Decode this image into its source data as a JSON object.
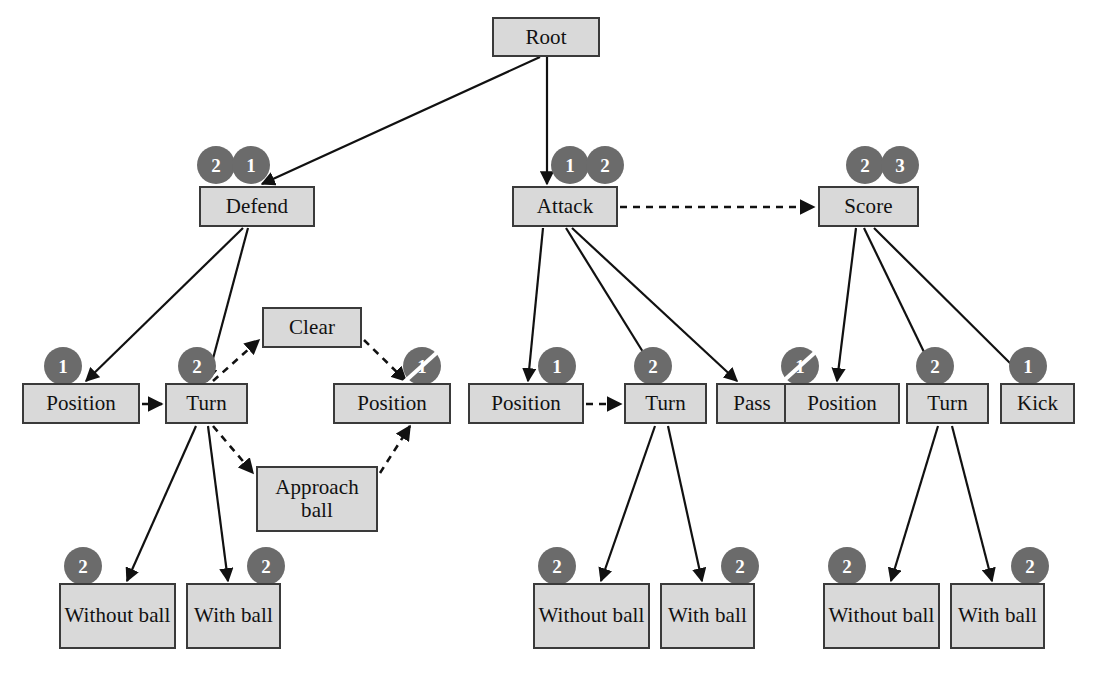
{
  "figure": {
    "background_color": "#ffffff",
    "node_fill": "#d9d9d9",
    "node_border": "#3a3a3a",
    "badge_fill": "#6b6b6b",
    "badge_text_color": "#ffffff",
    "edge_color": "#111111"
  },
  "header": {
    "running_head": "",
    "page_number": ""
  },
  "nodes": [
    {
      "id": "root",
      "label": "Root",
      "x": 492,
      "y": 17,
      "w": 108,
      "h": 40
    },
    {
      "id": "defend",
      "label": "Defend",
      "x": 199,
      "y": 186,
      "w": 116,
      "h": 41
    },
    {
      "id": "attack",
      "label": "Attack",
      "x": 512,
      "y": 186,
      "w": 106,
      "h": 41
    },
    {
      "id": "score",
      "label": "Score",
      "x": 818,
      "y": 186,
      "w": 101,
      "h": 41
    },
    {
      "id": "d-position",
      "label": "Position",
      "x": 22,
      "y": 383,
      "w": 118,
      "h": 41
    },
    {
      "id": "d-turn",
      "label": "Turn",
      "x": 165,
      "y": 383,
      "w": 83,
      "h": 41
    },
    {
      "id": "d-clear",
      "label": "Clear",
      "x": 262,
      "y": 307,
      "w": 100,
      "h": 41
    },
    {
      "id": "d-approach",
      "label": "Approach ball",
      "x": 256,
      "y": 466,
      "w": 122,
      "h": 66
    },
    {
      "id": "d-position2",
      "label": "Position",
      "x": 333,
      "y": 383,
      "w": 118,
      "h": 41
    },
    {
      "id": "d-without",
      "label": "Without ball",
      "x": 59,
      "y": 583,
      "w": 117,
      "h": 66
    },
    {
      "id": "d-with",
      "label": "With ball",
      "x": 186,
      "y": 583,
      "w": 95,
      "h": 66
    },
    {
      "id": "a-position",
      "label": "Position",
      "x": 468,
      "y": 383,
      "w": 116,
      "h": 41
    },
    {
      "id": "a-turn",
      "label": "Turn",
      "x": 624,
      "y": 383,
      "w": 83,
      "h": 41
    },
    {
      "id": "a-pass",
      "label": "Pass",
      "x": 716,
      "y": 383,
      "w": 72,
      "h": 41
    },
    {
      "id": "a-without",
      "label": "Without ball",
      "x": 533,
      "y": 583,
      "w": 117,
      "h": 66
    },
    {
      "id": "a-with",
      "label": "With ball",
      "x": 660,
      "y": 583,
      "w": 95,
      "h": 66
    },
    {
      "id": "s-position",
      "label": "Position",
      "x": 784,
      "y": 383,
      "w": 116,
      "h": 41
    },
    {
      "id": "s-turn",
      "label": "Turn",
      "x": 906,
      "y": 383,
      "w": 83,
      "h": 41
    },
    {
      "id": "s-kick",
      "label": "Kick",
      "x": 1000,
      "y": 383,
      "w": 75,
      "h": 41
    },
    {
      "id": "s-without",
      "label": "Without ball",
      "x": 823,
      "y": 583,
      "w": 117,
      "h": 66
    },
    {
      "id": "s-with",
      "label": "With ball",
      "x": 950,
      "y": 583,
      "w": 95,
      "h": 66
    }
  ],
  "badges": [
    {
      "for": "defend",
      "value": "2",
      "x": 197,
      "y": 146,
      "struck": false
    },
    {
      "for": "defend",
      "value": "1",
      "x": 232,
      "y": 146,
      "struck": false
    },
    {
      "for": "attack",
      "value": "1",
      "x": 551,
      "y": 146,
      "struck": false
    },
    {
      "for": "attack",
      "value": "2",
      "x": 586,
      "y": 146,
      "struck": false
    },
    {
      "for": "score",
      "value": "2",
      "x": 846,
      "y": 146,
      "struck": false
    },
    {
      "for": "score",
      "value": "3",
      "x": 881,
      "y": 146,
      "struck": false
    },
    {
      "for": "d-position",
      "value": "1",
      "x": 44,
      "y": 347,
      "struck": false
    },
    {
      "for": "d-turn",
      "value": "2",
      "x": 178,
      "y": 347,
      "struck": false
    },
    {
      "for": "d-position2",
      "value": "1",
      "x": 403,
      "y": 347,
      "struck": true
    },
    {
      "for": "d-without",
      "value": "2",
      "x": 64,
      "y": 547,
      "struck": false
    },
    {
      "for": "d-with",
      "value": "2",
      "x": 247,
      "y": 547,
      "struck": false
    },
    {
      "for": "a-position",
      "value": "1",
      "x": 538,
      "y": 347,
      "struck": false
    },
    {
      "for": "a-turn",
      "value": "2",
      "x": 634,
      "y": 347,
      "struck": false
    },
    {
      "for": "s-position",
      "value": "1",
      "x": 781,
      "y": 347,
      "struck": true
    },
    {
      "for": "s-turn",
      "value": "2",
      "x": 916,
      "y": 347,
      "struck": false
    },
    {
      "for": "s-kick",
      "value": "1",
      "x": 1009,
      "y": 347,
      "struck": false
    },
    {
      "for": "a-without",
      "value": "2",
      "x": 538,
      "y": 547,
      "struck": false
    },
    {
      "for": "a-with",
      "value": "2",
      "x": 721,
      "y": 547,
      "struck": false
    },
    {
      "for": "s-without",
      "value": "2",
      "x": 828,
      "y": 547,
      "struck": false
    },
    {
      "for": "s-with",
      "value": "2",
      "x": 1011,
      "y": 547,
      "struck": false
    }
  ],
  "edges": [
    {
      "from": "root",
      "to": "defend",
      "style": "solid",
      "x1": 540,
      "y1": 57,
      "x2": 262,
      "y2": 184
    },
    {
      "from": "root",
      "to": "attack",
      "style": "solid",
      "x1": 547,
      "y1": 57,
      "x2": 547,
      "y2": 184
    },
    {
      "from": "attack",
      "to": "score",
      "style": "dashed",
      "x1": 620,
      "y1": 207,
      "x2": 814,
      "y2": 207
    },
    {
      "from": "defend",
      "to": "d-position",
      "style": "solid",
      "x1": 243,
      "y1": 228,
      "x2": 86,
      "y2": 381
    },
    {
      "from": "defend",
      "to": "d-turn",
      "style": "solid",
      "x1": 248,
      "y1": 228,
      "x2": 207,
      "y2": 381
    },
    {
      "from": "d-position",
      "to": "d-turn",
      "style": "dashed",
      "x1": 142,
      "y1": 404,
      "x2": 162,
      "y2": 404
    },
    {
      "from": "d-turn",
      "to": "d-clear",
      "style": "dashed",
      "x1": 213,
      "y1": 381,
      "x2": 259,
      "y2": 340
    },
    {
      "from": "d-turn",
      "to": "d-approach",
      "style": "dashed",
      "x1": 213,
      "y1": 426,
      "x2": 253,
      "y2": 473
    },
    {
      "from": "d-clear",
      "to": "d-position2",
      "style": "dashed",
      "x1": 364,
      "y1": 340,
      "x2": 406,
      "y2": 381
    },
    {
      "from": "d-approach",
      "to": "d-position2",
      "style": "dashed",
      "x1": 380,
      "y1": 473,
      "x2": 410,
      "y2": 426
    },
    {
      "from": "d-turn",
      "to": "d-without",
      "style": "solid",
      "x1": 196,
      "y1": 426,
      "x2": 127,
      "y2": 581
    },
    {
      "from": "d-turn",
      "to": "d-with",
      "style": "solid",
      "x1": 208,
      "y1": 426,
      "x2": 228,
      "y2": 581
    },
    {
      "from": "attack",
      "to": "a-position",
      "style": "solid",
      "x1": 543,
      "y1": 228,
      "x2": 528,
      "y2": 381
    },
    {
      "from": "attack",
      "to": "a-turn",
      "style": "solid",
      "x1": 566,
      "y1": 228,
      "x2": 661,
      "y2": 381
    },
    {
      "from": "attack",
      "to": "a-pass",
      "style": "solid",
      "x1": 572,
      "y1": 228,
      "x2": 737,
      "y2": 381
    },
    {
      "from": "a-position",
      "to": "a-turn",
      "style": "dashed",
      "x1": 586,
      "y1": 404,
      "x2": 621,
      "y2": 404
    },
    {
      "from": "a-turn",
      "to": "a-without",
      "style": "solid",
      "x1": 655,
      "y1": 426,
      "x2": 601,
      "y2": 581
    },
    {
      "from": "a-turn",
      "to": "a-with",
      "style": "solid",
      "x1": 668,
      "y1": 426,
      "x2": 702,
      "y2": 581
    },
    {
      "from": "score",
      "to": "s-position",
      "style": "solid",
      "x1": 856,
      "y1": 228,
      "x2": 837,
      "y2": 381
    },
    {
      "from": "score",
      "to": "s-turn",
      "style": "solid",
      "x1": 864,
      "y1": 228,
      "x2": 938,
      "y2": 381
    },
    {
      "from": "score",
      "to": "s-kick",
      "style": "solid",
      "x1": 874,
      "y1": 228,
      "x2": 1028,
      "y2": 381
    },
    {
      "from": "s-turn",
      "to": "s-without",
      "style": "solid",
      "x1": 938,
      "y1": 426,
      "x2": 891,
      "y2": 581
    },
    {
      "from": "s-turn",
      "to": "s-with",
      "style": "solid",
      "x1": 952,
      "y1": 426,
      "x2": 992,
      "y2": 581
    }
  ]
}
